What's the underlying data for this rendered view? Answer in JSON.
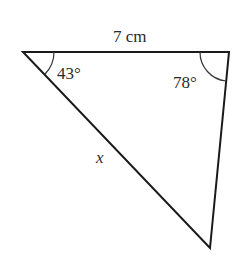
{
  "diagram": {
    "type": "triangle",
    "vertices": {
      "top_left": [
        23,
        52
      ],
      "top_right": [
        229,
        52
      ],
      "bottom": [
        210,
        248
      ]
    },
    "labels": {
      "top_side": "7 cm",
      "angle_top_left": "43°",
      "angle_top_right": "78°",
      "unknown_side": "x"
    },
    "line_color": "#1a1a1a"
  }
}
